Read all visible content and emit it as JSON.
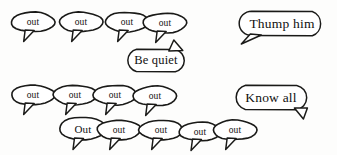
{
  "scene": {
    "title": "Speech balloon crowd illustration",
    "background_color": "#fdfdfc",
    "ink_color": "#1a1a18",
    "fill_color": "#ffffff",
    "width": 337,
    "height": 155
  },
  "balloons": [
    {
      "id": "out-r1-1",
      "text": "out",
      "style": "small",
      "tail": "down",
      "x": 10,
      "y": 11,
      "w": 46,
      "h": 22
    },
    {
      "id": "out-r1-2",
      "text": "out",
      "style": "small",
      "tail": "down",
      "x": 58,
      "y": 11,
      "w": 46,
      "h": 22
    },
    {
      "id": "out-r1-3",
      "text": "out",
      "style": "small",
      "tail": "down",
      "x": 104,
      "y": 11,
      "w": 46,
      "h": 22
    },
    {
      "id": "out-r1-4",
      "text": "out",
      "style": "small",
      "tail": "down",
      "x": 142,
      "y": 12,
      "w": 46,
      "h": 22
    },
    {
      "id": "thump-him",
      "text": "Thump him",
      "style": "wide",
      "tail": "down-left",
      "x": 238,
      "y": 10,
      "w": 88,
      "h": 27
    },
    {
      "id": "be-quiet",
      "text": "Be quiet",
      "style": "medium",
      "tail": "up-right",
      "x": 124,
      "y": 48,
      "w": 64,
      "h": 25
    },
    {
      "id": "out-r2-1",
      "text": "out",
      "style": "small",
      "tail": "down",
      "x": 10,
      "y": 84,
      "w": 46,
      "h": 22
    },
    {
      "id": "out-r2-2",
      "text": "out",
      "style": "small",
      "tail": "down",
      "x": 52,
      "y": 84,
      "w": 46,
      "h": 22
    },
    {
      "id": "out-r2-3",
      "text": "out",
      "style": "small",
      "tail": "down",
      "x": 92,
      "y": 84,
      "w": 46,
      "h": 22
    },
    {
      "id": "out-r2-4",
      "text": "out",
      "style": "small",
      "tail": "down",
      "x": 132,
      "y": 85,
      "w": 46,
      "h": 22
    },
    {
      "id": "know-all",
      "text": "Know all",
      "style": "wide",
      "tail": "down-right",
      "x": 232,
      "y": 84,
      "w": 78,
      "h": 27
    },
    {
      "id": "out-r3-1",
      "text": "Out",
      "style": "small-big",
      "tail": "down",
      "x": 58,
      "y": 116,
      "w": 50,
      "h": 25
    },
    {
      "id": "out-r3-2",
      "text": "out",
      "style": "small",
      "tail": "down",
      "x": 96,
      "y": 119,
      "w": 46,
      "h": 22
    },
    {
      "id": "out-r3-3",
      "text": "out",
      "style": "small",
      "tail": "down",
      "x": 138,
      "y": 119,
      "w": 46,
      "h": 22
    },
    {
      "id": "out-r3-4",
      "text": "out",
      "style": "small",
      "tail": "down",
      "x": 178,
      "y": 121,
      "w": 44,
      "h": 21
    },
    {
      "id": "out-r3-5",
      "text": "out",
      "style": "small",
      "tail": "down",
      "x": 212,
      "y": 119,
      "w": 46,
      "h": 22
    }
  ]
}
